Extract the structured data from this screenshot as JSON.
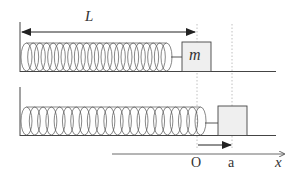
{
  "figure": {
    "labels": {
      "length": "L",
      "mass": "m",
      "origin": "O",
      "displacement": "a",
      "axis": "x"
    },
    "colors": {
      "line": "#444444",
      "coil": "#555555",
      "block_fill": "#eeeeee",
      "guide": "#aaaaaa"
    },
    "panels": [
      {
        "name": "natural-length",
        "spring_coils": 22
      },
      {
        "name": "stretched",
        "spring_coils": 22
      }
    ]
  }
}
